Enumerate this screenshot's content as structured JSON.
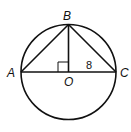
{
  "diagram": {
    "type": "geometry",
    "points": {
      "A": {
        "label": "A"
      },
      "B": {
        "label": "B"
      },
      "C": {
        "label": "C"
      },
      "O": {
        "label": "O"
      }
    },
    "segment_labels": {
      "OC": "8"
    },
    "right_angle_at": "O",
    "stroke_color": "#111111"
  }
}
